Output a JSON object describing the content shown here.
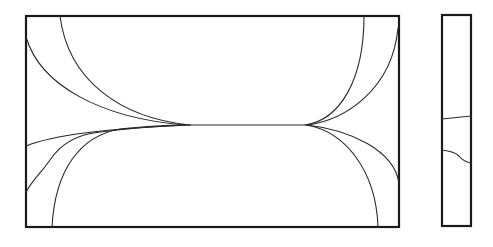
{
  "diagram": {
    "type": "line-drawing",
    "background": "#ffffff",
    "stroke_color": "#1a1a1a",
    "main_panel": {
      "x": 26,
      "y": 16,
      "width": 373,
      "height": 211,
      "center_line": {
        "y": 125,
        "x_start": 185,
        "x_end": 307
      },
      "curves": [
        {
          "id": "upper-left-outer",
          "d": "M 26 37 C 40 85, 100 118, 185 125"
        },
        {
          "id": "upper-left-inner",
          "d": "M 60 16 C 68 80, 120 118, 190 125"
        },
        {
          "id": "lower-left-top",
          "d": "M 26 146 C 60 132, 140 127, 190 125"
        },
        {
          "id": "lower-left-wavy",
          "d": "M 26 192 C 34 178, 42 172, 50 160 C 62 142, 80 134, 100 132 C 130 128, 160 126, 185 125"
        },
        {
          "id": "lower-left-bottom",
          "d": "M 52 227 C 55 170, 80 136, 120 129 C 150 126, 170 125, 185 125"
        },
        {
          "id": "upper-right-inner",
          "d": "M 364 16 C 364 80, 340 120, 305 125"
        },
        {
          "id": "upper-right-outer",
          "d": "M 398 28 C 392 90, 345 120, 307 125"
        },
        {
          "id": "lower-right-inner",
          "d": "M 307 125 C 345 132, 376 170, 378 227"
        },
        {
          "id": "lower-right-outer",
          "d": "M 307 125 C 350 130, 394 150, 399 183"
        }
      ]
    },
    "side_panel": {
      "x": 442,
      "y": 15,
      "width": 29,
      "height": 211,
      "curves": [
        {
          "id": "side-line-upper",
          "d": "M 442 119 L 471 116"
        },
        {
          "id": "side-line-lower-wavy",
          "d": "M 442 150 C 450 151, 455 152, 459 156 C 462 160, 466 162, 471 163"
        }
      ]
    }
  }
}
